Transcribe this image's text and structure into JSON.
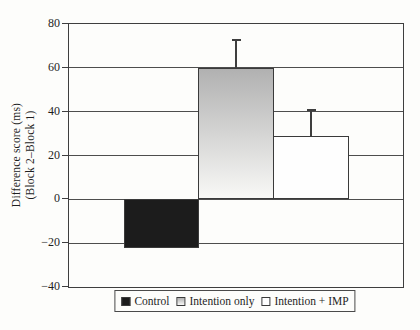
{
  "figure": {
    "background": "#fdfdfb"
  },
  "colors": {
    "axis_line": "#3e3e3e",
    "grid_line": "#4d4d4d",
    "text": "#1f1f1f",
    "bar_control": "#1c1c1c",
    "bar_intention_top": "#b1b1b1",
    "bar_intention_bottom": "#f8f8f6",
    "bar_imp": "#fefefe",
    "bar_border": "#3a3a3a",
    "error_bar": "#3e3e3e",
    "legend_border": "#4a4a4a"
  },
  "chart_data": {
    "type": "bar",
    "title": "",
    "xlabel": "",
    "ylabel_line1": "Difference score (ms)",
    "ylabel_line2": "(Block 2–Block 1)",
    "ylim": [
      -40,
      80
    ],
    "grid": true,
    "legend_position": "bottom",
    "yticks": [
      {
        "value": 80,
        "label": "80"
      },
      {
        "value": 60,
        "label": "60"
      },
      {
        "value": 40,
        "label": "40"
      },
      {
        "value": 20,
        "label": "20"
      },
      {
        "value": 0,
        "label": "0"
      },
      {
        "value": -20,
        "label": "−20"
      },
      {
        "value": -40,
        "label": "−40"
      }
    ],
    "categories": [
      "Control",
      "Intention only",
      "Intention + IMP"
    ],
    "values": [
      -22,
      60,
      29
    ],
    "upper_errors": [
      null,
      13,
      12
    ],
    "bar_styles": [
      "solid_dark",
      "gradient_gray",
      "white"
    ]
  },
  "legend": {
    "items": [
      {
        "label": "Control",
        "swatch": "solid_dark"
      },
      {
        "label": "Intention only",
        "swatch": "gradient_gray"
      },
      {
        "label": "Intention + IMP",
        "swatch": "white"
      }
    ]
  }
}
